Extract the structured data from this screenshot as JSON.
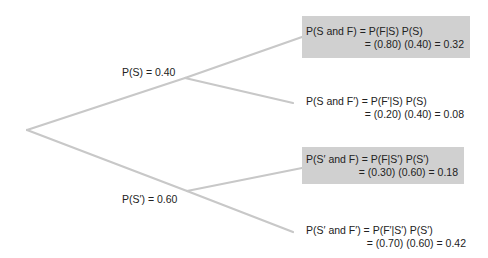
{
  "diagram": {
    "type": "probability-tree",
    "colors": {
      "branch": "#c8c8c8",
      "highlight_box": "#d0d0d0",
      "text": "#222222"
    },
    "first_level": [
      {
        "label": "P(S) = 0.40"
      },
      {
        "label": "P(S′) = 0.60"
      }
    ],
    "outcomes": [
      {
        "line1": "P(S and F) = P(F|S) P(S)",
        "line2": "= (0.80) (0.40) = 0.32",
        "highlighted": true
      },
      {
        "line1": "P(S and F′) = P(F′|S) P(S)",
        "line2": "= (0.20) (0.40) = 0.08",
        "highlighted": false
      },
      {
        "line1": "P(S′ and F) = P(F|S′) P(S′)",
        "line2": "= (0.30) (0.60) = 0.18",
        "highlighted": true
      },
      {
        "line1": "P(S′ and F′) = P(F′|S′) P(S′)",
        "line2": "= (0.70) (0.60) = 0.42",
        "highlighted": false
      }
    ]
  }
}
